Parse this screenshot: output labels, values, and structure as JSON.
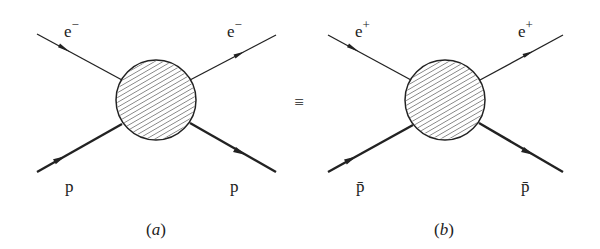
{
  "diagrams": [
    {
      "id": "a",
      "caption_open": "(",
      "caption_letter": "a",
      "caption_close": ")",
      "blob": {
        "cx": 156,
        "cy": 100,
        "r": 40
      },
      "lines": {
        "lepton_in": {
          "label": "e",
          "charge": "−",
          "x1": 37,
          "y1": 34,
          "x2": 122,
          "y2": 80
        },
        "lepton_out": {
          "label": "e",
          "charge": "−",
          "x1": 190,
          "y1": 80,
          "x2": 276,
          "y2": 35
        },
        "hadron_in": {
          "label": "p",
          "x1": 37,
          "y1": 172,
          "x2": 122,
          "y2": 124
        },
        "hadron_out": {
          "label": "p",
          "x1": 190,
          "y1": 123,
          "x2": 276,
          "y2": 172
        }
      }
    },
    {
      "id": "b",
      "caption_open": "(",
      "caption_letter": "b",
      "caption_close": ")",
      "blob": {
        "cx": 445,
        "cy": 100,
        "r": 40
      },
      "lines": {
        "lepton_in": {
          "label": "e",
          "charge": "+",
          "x1": 328,
          "y1": 35,
          "x2": 411,
          "y2": 80
        },
        "lepton_out": {
          "label": "e",
          "charge": "+",
          "x1": 480,
          "y1": 80,
          "x2": 563,
          "y2": 35
        },
        "hadron_in": {
          "label": "p̄",
          "x1": 328,
          "y1": 172,
          "x2": 413,
          "y2": 125
        },
        "hadron_out": {
          "label": "p̄",
          "x1": 479,
          "y1": 123,
          "x2": 563,
          "y2": 172
        }
      }
    }
  ],
  "equivalence_symbol": "≡"
}
